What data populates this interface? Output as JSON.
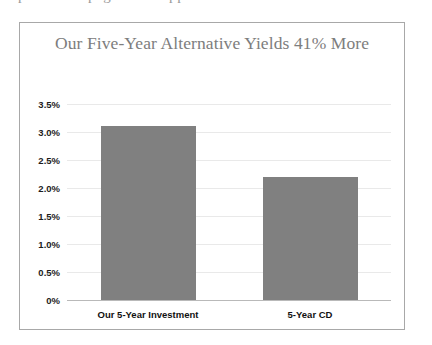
{
  "clipped_header_text": "portion of page text clipped above the chart",
  "chart_data": {
    "type": "bar",
    "title": "Our Five-Year Alternative Yields 41% More",
    "xlabel": "",
    "ylabel": "",
    "categories": [
      "Our 5-Year Investment",
      "5-Year CD"
    ],
    "values": [
      3.1,
      2.2
    ],
    "ylim": [
      0,
      3.5
    ],
    "ytick_labels": [
      "3.5%",
      "3.0%",
      "2.5%",
      "2.0%",
      "1.5%",
      "1.0%",
      "0.5%",
      "0%"
    ],
    "ytick_values": [
      3.5,
      3.0,
      2.5,
      2.0,
      1.5,
      1.0,
      0.5,
      0
    ],
    "grid": true,
    "legend": "none",
    "bar_color": "#808080",
    "title_color": "#7d7d7d",
    "gridline_color": "#e9e9e9",
    "axis_color": "#b9b9b9",
    "frame_color": "#a8a8a8"
  }
}
